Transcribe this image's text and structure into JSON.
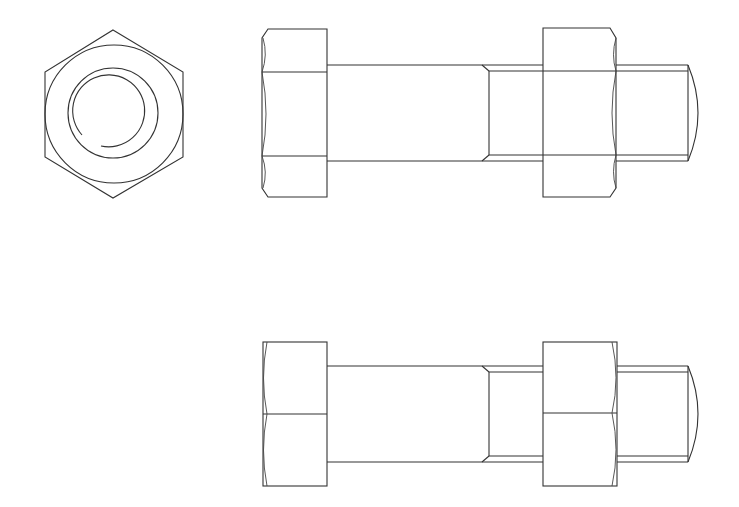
{
  "drawing": {
    "subject": "hex bolt with hex nut",
    "line_color": "#333333",
    "background": "#ffffff",
    "views": [
      {
        "name": "end-view",
        "label": ""
      },
      {
        "name": "front-view",
        "label": ""
      },
      {
        "name": "side-view",
        "label": ""
      }
    ]
  }
}
